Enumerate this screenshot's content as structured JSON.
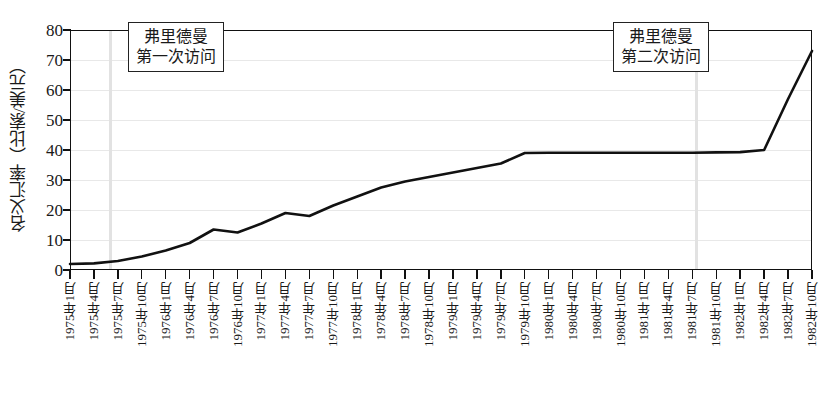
{
  "chart_data": {
    "type": "line",
    "title": "",
    "xlabel": "",
    "ylabel": "名义汇率（比索/美元）",
    "ylim": [
      0,
      80
    ],
    "yticks": [
      0,
      10,
      20,
      30,
      40,
      50,
      60,
      70,
      80
    ],
    "ytick_labels": [
      "0",
      "10",
      "20",
      "30",
      "40",
      "50",
      "60",
      "70",
      "80"
    ],
    "grid": true,
    "legend": "none",
    "categories": [
      "1975年1月",
      "1975年4月",
      "1975年7月",
      "1975年10月",
      "1976年1月",
      "1976年4月",
      "1976年7月",
      "1976年10月",
      "1977年1月",
      "1977年4月",
      "1977年7月",
      "1977年10月",
      "1978年1月",
      "1978年4月",
      "1978年7月",
      "1978年10月",
      "1979年1月",
      "1979年4月",
      "1979年7月",
      "1979年10月",
      "1980年1月",
      "1980年4月",
      "1980年7月",
      "1980年10月",
      "1981年1月",
      "1981年4月",
      "1981年7月",
      "1981年10月",
      "1982年1月",
      "1982年4月",
      "1982年7月",
      "1982年10月"
    ],
    "series": [
      {
        "name": "名义汇率",
        "values": [
          2.0,
          2.2,
          3.0,
          4.5,
          6.5,
          9.0,
          13.5,
          12.5,
          15.5,
          19.0,
          18.0,
          21.5,
          24.5,
          27.5,
          29.5,
          31.0,
          32.5,
          34.0,
          35.5,
          39.0,
          39.1,
          39.1,
          39.1,
          39.1,
          39.1,
          39.1,
          39.1,
          39.2,
          39.3,
          40.0,
          57.0,
          73.0
        ]
      }
    ],
    "annotations": [
      {
        "id": "friedman-visit-1",
        "line1": "弗里德曼",
        "line2": "第一次访问",
        "marker_category": "1975年4月",
        "marker_x_fraction": 0.055
      },
      {
        "id": "friedman-visit-2",
        "line1": "弗里德曼",
        "line2": "第二次访问",
        "marker_category": "1981年1月",
        "marker_x_fraction": 0.845
      }
    ],
    "colors": {
      "line": "#111111",
      "axis": "#111111",
      "grid": "#e8e8e8",
      "marker": "#e2e2e2",
      "background": "#ffffff"
    }
  }
}
